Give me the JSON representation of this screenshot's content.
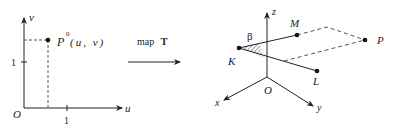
{
  "left_plot": {
    "axis_u": "u",
    "axis_v": "v",
    "origin": "O",
    "tick_u": "1",
    "tick_v": "1",
    "point_label": "P",
    "point_superscript": "0",
    "point_coords": "(u, v)"
  },
  "mapping": {
    "text": "map",
    "symbol": "T"
  },
  "right_plot": {
    "axis_x": "x",
    "axis_y": "y",
    "axis_z": "z",
    "origin": "O",
    "points": {
      "K": "K",
      "M": "M",
      "L": "L",
      "P": "P"
    },
    "angle": "β"
  },
  "colors": {
    "ink": "#222222",
    "dash": "#555555"
  }
}
